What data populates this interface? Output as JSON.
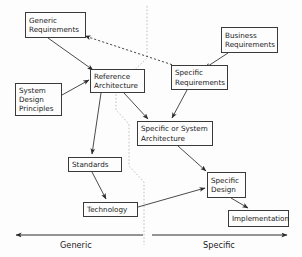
{
  "diagram": {
    "background_color": "#fdfdfd",
    "line_color": "#3a3a3a",
    "divider_color": "#b8b8b8",
    "nodes": [
      {
        "id": "generic-requirements",
        "label": "Generic\nRequirements",
        "x": 25,
        "y": 12,
        "w": 61,
        "h": 26
      },
      {
        "id": "business-requirements",
        "label": "Business\nRequirements",
        "x": 221,
        "y": 27,
        "w": 57,
        "h": 26
      },
      {
        "id": "reference-architecture",
        "label": "Reference\nArchitecture",
        "x": 90,
        "y": 69,
        "w": 55,
        "h": 24
      },
      {
        "id": "specific-requirements",
        "label": "Specific\nRequirements",
        "x": 171,
        "y": 65,
        "w": 57,
        "h": 25
      },
      {
        "id": "system-design-principles",
        "label": "System\nDesign\nPrinciples",
        "x": 15,
        "y": 83,
        "w": 47,
        "h": 33
      },
      {
        "id": "specific-or-system-architecture",
        "label": "Specific or System\nArchitecture",
        "x": 137,
        "y": 121,
        "w": 76,
        "h": 25
      },
      {
        "id": "standards",
        "label": "Standards",
        "x": 68,
        "y": 157,
        "w": 54,
        "h": 15
      },
      {
        "id": "specific-design",
        "label": "Specific\nDesign",
        "x": 207,
        "y": 172,
        "w": 39,
        "h": 26
      },
      {
        "id": "technology",
        "label": "Technology",
        "x": 83,
        "y": 202,
        "w": 55,
        "h": 15
      },
      {
        "id": "implementation",
        "label": "Implementation",
        "x": 228,
        "y": 210,
        "w": 61,
        "h": 17
      }
    ],
    "axis": {
      "left_label": "Generic",
      "right_label": "Specific"
    }
  }
}
